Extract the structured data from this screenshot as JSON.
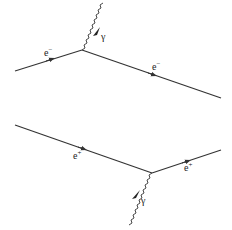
{
  "diagrams": [
    {
      "name": "electron-emits-photon",
      "incoming_label": "e",
      "incoming_charge": "−",
      "outgoing_label": "e",
      "outgoing_charge": "−",
      "photon_label": "γ"
    },
    {
      "name": "positron-absorbs-photon",
      "incoming_label": "e",
      "incoming_charge": "+",
      "outgoing_label": "e",
      "outgoing_charge": "+",
      "photon_label": "γ"
    }
  ],
  "colors": {
    "line": "#333333",
    "background": "#ffffff"
  }
}
